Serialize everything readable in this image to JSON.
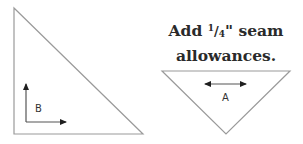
{
  "instruction": {
    "line1_prefix": "Add ",
    "fraction_numerator": "1",
    "fraction_slash": "/",
    "fraction_denominator": "4",
    "line1_suffix": "\" seam",
    "line2": "allowances."
  },
  "pieces": [
    {
      "id": "B",
      "label": "B",
      "shape": "right-triangle",
      "grain": "two perpendicular arrows (up and right)"
    },
    {
      "id": "A",
      "label": "A",
      "shape": "inverted-isosceles-triangle",
      "grain": "horizontal double-headed arrow"
    }
  ],
  "colors": {
    "outline": "#9a9a9a",
    "arrow": "#1f1f1f",
    "text": "#2a2a2a",
    "background": "#ffffff"
  }
}
